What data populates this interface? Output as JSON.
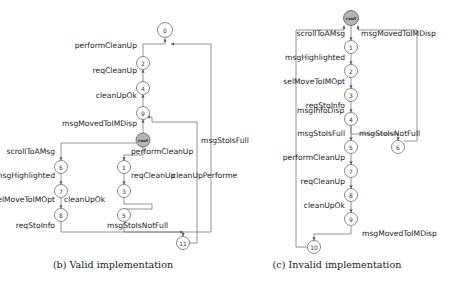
{
  "figure": {
    "panels": [
      {
        "id": "panel-b",
        "caption": "(b) Valid implementation",
        "caption_x": 113,
        "caption_y": 268,
        "nodes": [
          {
            "id": "n0",
            "label": "0",
            "x": 165,
            "y": 30,
            "r": 7.5,
            "kind": "state"
          },
          {
            "id": "n2",
            "label": "2",
            "x": 143,
            "y": 63,
            "r": 6.5,
            "kind": "state"
          },
          {
            "id": "n4",
            "label": "4",
            "x": 143,
            "y": 88,
            "r": 6.5,
            "kind": "state"
          },
          {
            "id": "n9",
            "label": "9",
            "x": 143,
            "y": 113,
            "r": 6.5,
            "kind": "state"
          },
          {
            "id": "nroot",
            "label": "root",
            "x": 143,
            "y": 140,
            "r": 7.0,
            "kind": "root"
          },
          {
            "id": "n6",
            "label": "6",
            "x": 61,
            "y": 167,
            "r": 6.5,
            "kind": "state"
          },
          {
            "id": "n7",
            "label": "7",
            "x": 61,
            "y": 191,
            "r": 6.5,
            "kind": "state"
          },
          {
            "id": "n8",
            "label": "8",
            "x": 61,
            "y": 215,
            "r": 6.5,
            "kind": "state"
          },
          {
            "id": "n1",
            "label": "1",
            "x": 124,
            "y": 167,
            "r": 6.5,
            "kind": "state"
          },
          {
            "id": "n3",
            "label": "3",
            "x": 124,
            "y": 191,
            "r": 6.5,
            "kind": "state"
          },
          {
            "id": "n5",
            "label": "5",
            "x": 124,
            "y": 215,
            "r": 6.5,
            "kind": "state"
          },
          {
            "id": "n11",
            "label": "11",
            "x": 183,
            "y": 243,
            "r": 6.5,
            "kind": "state"
          }
        ],
        "edges": [
          {
            "id": "e-b-1",
            "from": "n2",
            "to": "n0",
            "d": "M 143 56.5 L 143 44 L 165 44 L 165 38.5"
          },
          {
            "id": "e-b-2",
            "from": "n4",
            "to": "n2",
            "d": "M 143 81.5 L 143 69.5"
          },
          {
            "id": "e-b-3",
            "from": "n9",
            "to": "n4",
            "d": "M 143 106.5 L 143 94.5"
          },
          {
            "id": "e-b-4",
            "from": "nroot",
            "to": "n9",
            "d": "M 143 133 L 143 119.5"
          },
          {
            "id": "e-b-5",
            "from": "nroot",
            "to": "n6",
            "d": "M 136 143 L 61 143 L 61 160.5"
          },
          {
            "id": "e-b-6",
            "from": "nroot",
            "to": "n1",
            "d": "M 143 147 L 143 155 L 124 155 L 124 160.5"
          },
          {
            "id": "e-b-7",
            "from": "n6",
            "to": "n7",
            "d": "M 61 173.5 L 61 184.5"
          },
          {
            "id": "e-b-8",
            "from": "n7",
            "to": "n8",
            "d": "M 61 197.5 L 61 208.5"
          },
          {
            "id": "e-b-9",
            "from": "n1",
            "to": "n3",
            "d": "M 124 173.5 L 124 184.5"
          },
          {
            "id": "e-b-10",
            "from": "n3",
            "to": "n5",
            "d": "M 124 197.5 L 124 204 L 152 204 L 152 209 L 130 209 L 124 209 L 124 208.5"
          },
          {
            "id": "e-b-11",
            "from": "n8",
            "to": "n11",
            "d": "M 61 221.5 L 61 232 L 183 232 L 183 236.5"
          },
          {
            "id": "e-b-12",
            "from": "n5",
            "to": "n11",
            "d": "M 124 221.5 L 124 232 L 183 232"
          },
          {
            "id": "e-b-13",
            "from": "n11",
            "to": "n9",
            "d": "M 190 243 L 197 243 L 197 122 L 152 122 L 152 117 L 147 117"
          },
          {
            "id": "e-b-14",
            "from": "n11",
            "to": "n0",
            "d": "M 183 236.5 L 183 232 L 211 232 L 211 44 L 171 44"
          }
        ],
        "edge_labels": [
          {
            "id": "lb-1",
            "text": "performCleanUp",
            "x": 137,
            "y": 48,
            "anchor": "end"
          },
          {
            "id": "lb-2",
            "text": "reqCleanUp",
            "x": 137,
            "y": 73,
            "anchor": "end"
          },
          {
            "id": "lb-3",
            "text": "cleanUpOk",
            "x": 137,
            "y": 98,
            "anchor": "end"
          },
          {
            "id": "lb-4",
            "text": "msgMovedToIMDisp",
            "x": 137,
            "y": 126,
            "anchor": "end"
          },
          {
            "id": "lb-5",
            "text": "scrollToAMsg",
            "x": 55,
            "y": 154,
            "anchor": "end"
          },
          {
            "id": "lb-6",
            "text": "performCleanUp",
            "x": 131,
            "y": 154,
            "anchor": "start"
          },
          {
            "id": "lb-7",
            "text": "msgHighlighted",
            "x": 55,
            "y": 178,
            "anchor": "end"
          },
          {
            "id": "lb-8",
            "text": "reqCleanUp",
            "x": 131,
            "y": 178,
            "anchor": "start"
          },
          {
            "id": "lb-9",
            "text": "selMoveToIMOpt",
            "x": 55,
            "y": 202,
            "anchor": "end"
          },
          {
            "id": "lb-10",
            "text": "cleanUpOk",
            "x": 64,
            "y": 202,
            "anchor": "start"
          },
          {
            "id": "lb-11",
            "text": "reqStoInfo",
            "x": 55,
            "y": 228,
            "anchor": "end"
          },
          {
            "id": "lb-12",
            "text": "msgStoIsNotFull",
            "x": 107,
            "y": 228,
            "anchor": "start"
          },
          {
            "id": "lb-13",
            "text": "msgStoIsFull",
            "x": 201,
            "y": 143,
            "anchor": "start"
          },
          {
            "id": "lb-14",
            "text": "cleanUpPerforme",
            "x": 172,
            "y": 178,
            "anchor": "start"
          }
        ]
      },
      {
        "id": "panel-c",
        "caption": "(c) Invalid implementation",
        "caption_x": 337,
        "caption_y": 268,
        "nodes": [
          {
            "id": "m-root",
            "label": "root",
            "x": 351,
            "y": 18,
            "r": 7.5,
            "kind": "root"
          },
          {
            "id": "m1",
            "label": "1",
            "x": 351,
            "y": 47,
            "r": 6.5,
            "kind": "state"
          },
          {
            "id": "m2",
            "label": "2",
            "x": 351,
            "y": 71,
            "r": 6.5,
            "kind": "state"
          },
          {
            "id": "m3",
            "label": "3",
            "x": 351,
            "y": 95,
            "r": 6.5,
            "kind": "state"
          },
          {
            "id": "m4",
            "label": "4",
            "x": 351,
            "y": 119,
            "r": 6.5,
            "kind": "state"
          },
          {
            "id": "m5",
            "label": "5",
            "x": 351,
            "y": 147,
            "r": 6.5,
            "kind": "state"
          },
          {
            "id": "m7",
            "label": "7",
            "x": 351,
            "y": 171,
            "r": 6.5,
            "kind": "state"
          },
          {
            "id": "m8",
            "label": "8",
            "x": 351,
            "y": 195,
            "r": 6.5,
            "kind": "state"
          },
          {
            "id": "m9",
            "label": "9",
            "x": 351,
            "y": 219,
            "r": 6.5,
            "kind": "state"
          },
          {
            "id": "m6",
            "label": "6",
            "x": 398,
            "y": 147,
            "r": 6.5,
            "kind": "state"
          },
          {
            "id": "m10",
            "label": "10",
            "x": 314,
            "y": 247,
            "r": 6.5,
            "kind": "state"
          }
        ],
        "edges": [
          {
            "id": "e-c-1",
            "from": "m-root",
            "to": "m1",
            "d": "M 351 25.5 L 351 40.5"
          },
          {
            "id": "e-c-2",
            "from": "m1",
            "to": "m2",
            "d": "M 351 53.5 L 351 64.5"
          },
          {
            "id": "e-c-3",
            "from": "m2",
            "to": "m3",
            "d": "M 351 77.5 L 351 88.5"
          },
          {
            "id": "e-c-4",
            "from": "m3",
            "to": "m4",
            "d": "M 351 101.5 L 351 112.5"
          },
          {
            "id": "e-c-5",
            "from": "m4",
            "to": "m5",
            "d": "M 351 125.5 L 351 140.5"
          },
          {
            "id": "e-c-6",
            "from": "m4",
            "to": "m6",
            "d": "M 351 125.5 L 351 134 L 398 134 L 398 140.5"
          },
          {
            "id": "e-c-7",
            "from": "m5",
            "to": "m7",
            "d": "M 351 153.5 L 351 164.5"
          },
          {
            "id": "e-c-8",
            "from": "m7",
            "to": "m8",
            "d": "M 351 177.5 L 351 188.5"
          },
          {
            "id": "e-c-9",
            "from": "m8",
            "to": "m9",
            "d": "M 351 201.5 L 351 212.5"
          },
          {
            "id": "e-c-10",
            "from": "m9",
            "to": "m10",
            "d": "M 351 225.5 L 351 234 L 314 234 L 314 240.5"
          },
          {
            "id": "e-c-11",
            "from": "m10",
            "to": "m-root",
            "d": "M 307 247 L 296 247 L 296 30 L 344 30 L 344 25.5"
          },
          {
            "id": "e-c-12",
            "from": "m6",
            "to": "m-root",
            "d": "M 404 141 L 417 141 L 417 30 L 358 30 L 358 25.5"
          }
        ],
        "edge_labels": [
          {
            "id": "lc-1",
            "text": "scrollToAMsg",
            "x": 345,
            "y": 36,
            "anchor": "end"
          },
          {
            "id": "lc-2",
            "text": "msgMovedToIMDisp",
            "x": 361,
            "y": 36,
            "anchor": "start"
          },
          {
            "id": "lc-3",
            "text": "msgHighlighted",
            "x": 345,
            "y": 60,
            "anchor": "end"
          },
          {
            "id": "lc-4",
            "text": "selMoveToIMOpt",
            "x": 345,
            "y": 84,
            "anchor": "end"
          },
          {
            "id": "lc-5",
            "text": "reqStoInfo",
            "x": 345,
            "y": 108,
            "anchor": "end"
          },
          {
            "id": "lc-6",
            "text": "msgInfoDisp",
            "x": 297,
            "y": 113,
            "anchor": "start"
          },
          {
            "id": "lc-7",
            "text": "msgStoIsFull",
            "x": 345,
            "y": 136,
            "anchor": "end"
          },
          {
            "id": "lc-8",
            "text": "msgStoIsNotFull",
            "x": 359,
            "y": 136,
            "anchor": "start"
          },
          {
            "id": "lc-9",
            "text": "performCleanUp",
            "x": 345,
            "y": 160,
            "anchor": "end"
          },
          {
            "id": "lc-10",
            "text": "reqCleanUp",
            "x": 345,
            "y": 184,
            "anchor": "end"
          },
          {
            "id": "lc-11",
            "text": "cleanUpOk",
            "x": 345,
            "y": 208,
            "anchor": "end"
          },
          {
            "id": "lc-12",
            "text": "msgMovedToIMDisp",
            "x": 362,
            "y": 236,
            "anchor": "start"
          }
        ]
      }
    ]
  }
}
